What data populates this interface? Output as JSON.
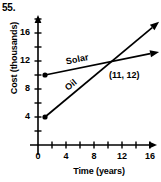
{
  "problem": {
    "number": "55."
  },
  "chart_data": {
    "type": "line",
    "title": "",
    "xlabel": "Time (years)",
    "ylabel": "Cost (thousands)",
    "xlim": [
      0,
      18
    ],
    "ylim": [
      0,
      19
    ],
    "xticks": [
      0,
      2,
      4,
      6,
      8,
      10,
      12,
      14,
      16,
      18
    ],
    "xtick_labels": [
      "0",
      "4",
      "8",
      "12",
      "16"
    ],
    "xtick_label_values": [
      0,
      4,
      8,
      12,
      16
    ],
    "yticks": [
      2,
      4,
      6,
      8,
      10,
      12,
      14,
      16,
      18
    ],
    "ytick_labels": [
      "4",
      "8",
      "12",
      "16"
    ],
    "ytick_label_values": [
      4,
      8,
      12,
      16
    ],
    "grid": false,
    "legend_position": "inline-on-line",
    "series": [
      {
        "name": "Solar",
        "label": "Solar",
        "start": {
          "x": 1,
          "y": 10
        },
        "end": {
          "x": 17.3,
          "y": 13.3
        },
        "has_start_dot": true,
        "has_end_arrow": true
      },
      {
        "name": "Oil",
        "label": "Oil",
        "start": {
          "x": 1,
          "y": 4
        },
        "end": {
          "x": 17.3,
          "y": 17.6
        },
        "has_start_dot": true,
        "has_end_arrow": true
      }
    ],
    "annotations": [
      {
        "text": "(11, 12)",
        "point": {
          "x": 11,
          "y": 12
        },
        "name": "intersection-point-label"
      }
    ]
  },
  "axes": {
    "x_arrow": true,
    "y_arrow": true
  }
}
